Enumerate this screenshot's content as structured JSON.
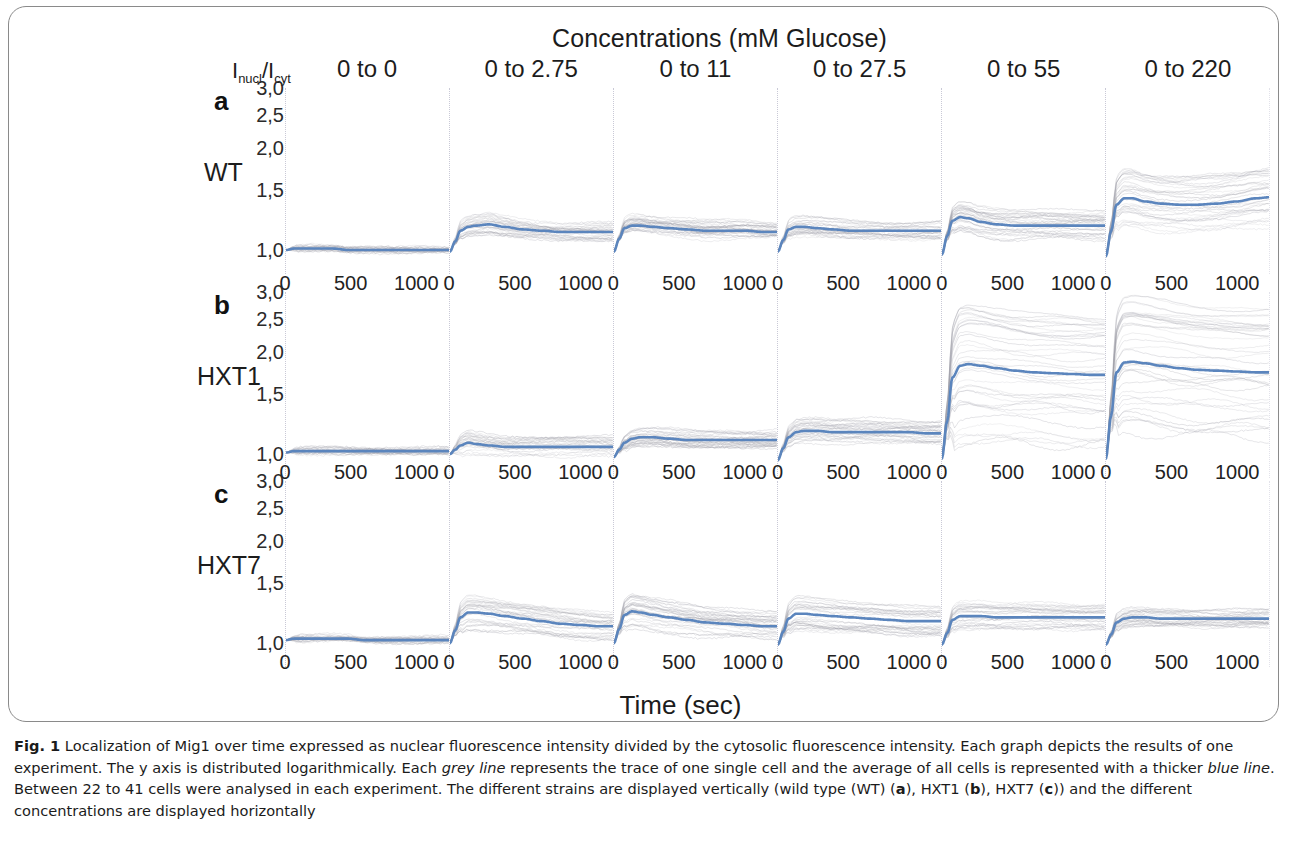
{
  "figure": {
    "title": "Concentrations (mM Glucose)",
    "ratio_axis_label": "Inucl/Icyt",
    "ratio_axis_main": "I",
    "ratio_axis_sub1": "nucl",
    "ratio_axis_slash": "/I",
    "ratio_axis_sub2": "cyt",
    "x_axis_title": "Time (sec)"
  },
  "caption": {
    "figure_number": "Fig. 1",
    "line1": " Localization of Mig1 over time expressed as nuclear fluorescence intensity divided by the cytosolic fluorescence intensity. Each graph depicts the results of one experiment. The y axis is distributed logarithmically. Each ",
    "grey_line": "grey line",
    "line2": " represents the trace of one single cell and the average of all cells is represented with a thicker ",
    "blue_line": "blue line",
    "line3": ". Between 22 to 41 cells were analysed in each experiment. The different strains are displayed vertically (wild type (WT) (",
    "bold_a": "a",
    "line4": "), HXT1 (",
    "bold_b": "b",
    "line5": "), HXT7 (",
    "bold_c": "c",
    "line6": ")) and the different concentrations are displayed horizontally"
  },
  "colors": {
    "average_line": "#5b85bd",
    "cell_trace": "#9a9aa4",
    "grid": "#c9c9d6",
    "text": "#1c1c1c",
    "frame": "#8a8a8a"
  },
  "chart_data": {
    "type": "line",
    "title": "Concentrations (mM Glucose)",
    "xlabel": "Time (sec)",
    "ylabel": "Inucl/Icyt",
    "y_scale": "logarithmic",
    "xlim": [
      0,
      1250
    ],
    "ylim": [
      0.85,
      3.0
    ],
    "xticks": [
      0,
      500,
      1000
    ],
    "xtick_labels": [
      "0",
      "500",
      "1000"
    ],
    "yticks": [
      1.0,
      1.5,
      2.0,
      2.5,
      3.0
    ],
    "ytick_labels": [
      "1,0",
      "1,5",
      "2,0",
      "2,5",
      "3,0"
    ],
    "grid": false,
    "legend": "none",
    "columns": [
      "0 to 0",
      "0 to 2.75",
      "0 to 11",
      "0 to 27.5",
      "0 to 55",
      "0 to 220"
    ],
    "rows": [
      {
        "panel": "a",
        "strain": "WT"
      },
      {
        "panel": "b",
        "strain": "HXT1"
      },
      {
        "panel": "c",
        "strain": "HXT7"
      }
    ],
    "cells_analysed_range": "22 to 41",
    "panels": [
      {
        "row": "a",
        "strain": "WT",
        "column": "0 to 0",
        "average": {
          "x": [
            0,
            60,
            120,
            240,
            360,
            480,
            600,
            720,
            840,
            960,
            1080,
            1200
          ],
          "y": [
            1.0,
            1.01,
            1.01,
            1.01,
            1.01,
            1.0,
            1.0,
            1.0,
            1.0,
            1.0,
            1.0,
            1.0
          ]
        },
        "spread": 0.05,
        "n_traces": 24
      },
      {
        "row": "a",
        "strain": "WT",
        "column": "0 to 2.75",
        "average": {
          "x": [
            0,
            40,
            80,
            140,
            200,
            300,
            420,
            560,
            700,
            850,
            1000,
            1150,
            1250
          ],
          "y": [
            0.99,
            1.06,
            1.14,
            1.17,
            1.18,
            1.19,
            1.17,
            1.15,
            1.14,
            1.13,
            1.13,
            1.13,
            1.13
          ]
        },
        "spread": 0.1,
        "n_traces": 30
      },
      {
        "row": "a",
        "strain": "WT",
        "column": "0 to 11",
        "average": {
          "x": [
            0,
            40,
            80,
            140,
            200,
            300,
            420,
            560,
            700,
            850,
            1000,
            1150,
            1250
          ],
          "y": [
            0.99,
            1.08,
            1.16,
            1.18,
            1.18,
            1.17,
            1.16,
            1.15,
            1.14,
            1.14,
            1.14,
            1.13,
            1.13
          ]
        },
        "spread": 0.11,
        "n_traces": 30
      },
      {
        "row": "a",
        "strain": "WT",
        "column": "0 to 27.5",
        "average": {
          "x": [
            0,
            40,
            80,
            140,
            200,
            300,
            420,
            560,
            700,
            850,
            1000,
            1150,
            1250
          ],
          "y": [
            0.99,
            1.07,
            1.15,
            1.17,
            1.17,
            1.16,
            1.15,
            1.14,
            1.14,
            1.14,
            1.14,
            1.14,
            1.14
          ]
        },
        "spread": 0.1,
        "n_traces": 28
      },
      {
        "row": "a",
        "strain": "WT",
        "column": "0 to 55",
        "average": {
          "x": [
            0,
            40,
            80,
            140,
            200,
            300,
            420,
            560,
            700,
            850,
            1000,
            1150,
            1250
          ],
          "y": [
            0.97,
            1.1,
            1.22,
            1.25,
            1.24,
            1.21,
            1.19,
            1.18,
            1.18,
            1.18,
            1.18,
            1.18,
            1.18
          ]
        },
        "spread": 0.16,
        "n_traces": 32
      },
      {
        "row": "a",
        "strain": "WT",
        "column": "0 to 220",
        "average": {
          "x": [
            0,
            40,
            80,
            140,
            200,
            300,
            420,
            560,
            700,
            850,
            1000,
            1150,
            1250
          ],
          "y": [
            0.96,
            1.14,
            1.36,
            1.42,
            1.42,
            1.39,
            1.37,
            1.36,
            1.36,
            1.37,
            1.39,
            1.42,
            1.43
          ]
        },
        "spread": 0.22,
        "n_traces": 34
      },
      {
        "row": "b",
        "strain": "HXT1",
        "column": "0 to 0",
        "average": {
          "x": [
            0,
            60,
            120,
            240,
            360,
            480,
            600,
            720,
            840,
            960,
            1080,
            1200
          ],
          "y": [
            1.01,
            1.02,
            1.02,
            1.02,
            1.02,
            1.02,
            1.02,
            1.02,
            1.02,
            1.02,
            1.02,
            1.02
          ]
        },
        "spread": 0.05,
        "n_traces": 25
      },
      {
        "row": "b",
        "strain": "HXT1",
        "column": "0 to 2.75",
        "average": {
          "x": [
            0,
            40,
            80,
            140,
            200,
            300,
            420,
            560,
            700,
            850,
            1000,
            1150,
            1250
          ],
          "y": [
            1.0,
            1.03,
            1.06,
            1.08,
            1.07,
            1.06,
            1.05,
            1.05,
            1.05,
            1.05,
            1.05,
            1.05,
            1.05
          ]
        },
        "spread": 0.14,
        "n_traces": 26
      },
      {
        "row": "b",
        "strain": "HXT1",
        "column": "0 to 11",
        "average": {
          "x": [
            0,
            40,
            80,
            140,
            200,
            300,
            420,
            560,
            700,
            850,
            1000,
            1150,
            1250
          ],
          "y": [
            0.98,
            1.03,
            1.08,
            1.11,
            1.12,
            1.12,
            1.11,
            1.1,
            1.1,
            1.1,
            1.1,
            1.1,
            1.1
          ]
        },
        "spread": 0.11,
        "n_traces": 30
      },
      {
        "row": "b",
        "strain": "HXT1",
        "column": "0 to 27.5",
        "average": {
          "x": [
            0,
            40,
            80,
            140,
            200,
            300,
            420,
            560,
            700,
            850,
            1000,
            1150,
            1250
          ],
          "y": [
            0.96,
            1.04,
            1.12,
            1.16,
            1.17,
            1.17,
            1.16,
            1.16,
            1.16,
            1.16,
            1.16,
            1.15,
            1.15
          ]
        },
        "spread": 0.13,
        "n_traces": 30
      },
      {
        "row": "b",
        "strain": "HXT1",
        "column": "0 to 55",
        "average": {
          "x": [
            0,
            40,
            80,
            140,
            200,
            300,
            420,
            560,
            700,
            850,
            1000,
            1150,
            1250
          ],
          "y": [
            0.97,
            1.25,
            1.68,
            1.82,
            1.84,
            1.82,
            1.79,
            1.76,
            1.74,
            1.73,
            1.72,
            1.71,
            1.71
          ]
        },
        "spread": 0.38,
        "n_traces": 36
      },
      {
        "row": "b",
        "strain": "HXT1",
        "column": "0 to 220",
        "average": {
          "x": [
            0,
            40,
            80,
            140,
            200,
            300,
            420,
            560,
            700,
            850,
            1000,
            1150,
            1250
          ],
          "y": [
            0.97,
            1.3,
            1.74,
            1.86,
            1.87,
            1.85,
            1.82,
            1.79,
            1.77,
            1.76,
            1.75,
            1.74,
            1.74
          ]
        },
        "spread": 0.44,
        "n_traces": 38
      },
      {
        "row": "c",
        "strain": "HXT7",
        "column": "0 to 0",
        "average": {
          "x": [
            0,
            60,
            120,
            240,
            360,
            480,
            600,
            720,
            840,
            960,
            1080,
            1200
          ],
          "y": [
            1.02,
            1.03,
            1.03,
            1.03,
            1.03,
            1.03,
            1.02,
            1.02,
            1.02,
            1.02,
            1.02,
            1.02
          ]
        },
        "spread": 0.05,
        "n_traces": 24
      },
      {
        "row": "c",
        "strain": "HXT7",
        "column": "0 to 2.75",
        "average": {
          "x": [
            0,
            40,
            80,
            140,
            200,
            300,
            420,
            560,
            700,
            850,
            1000,
            1150,
            1250
          ],
          "y": [
            1.0,
            1.09,
            1.19,
            1.23,
            1.23,
            1.22,
            1.2,
            1.18,
            1.16,
            1.14,
            1.13,
            1.12,
            1.12
          ]
        },
        "spread": 0.16,
        "n_traces": 30
      },
      {
        "row": "c",
        "strain": "HXT7",
        "column": "0 to 11",
        "average": {
          "x": [
            0,
            40,
            80,
            140,
            200,
            300,
            420,
            560,
            700,
            850,
            1000,
            1150,
            1250
          ],
          "y": [
            1.0,
            1.1,
            1.21,
            1.24,
            1.23,
            1.21,
            1.19,
            1.17,
            1.15,
            1.14,
            1.13,
            1.12,
            1.12
          ]
        },
        "spread": 0.17,
        "n_traces": 30
      },
      {
        "row": "c",
        "strain": "HXT7",
        "column": "0 to 27.5",
        "average": {
          "x": [
            0,
            40,
            80,
            140,
            200,
            300,
            420,
            560,
            700,
            850,
            1000,
            1150,
            1250
          ],
          "y": [
            0.99,
            1.08,
            1.18,
            1.22,
            1.22,
            1.21,
            1.2,
            1.19,
            1.18,
            1.17,
            1.16,
            1.16,
            1.16
          ]
        },
        "spread": 0.16,
        "n_traces": 30
      },
      {
        "row": "c",
        "strain": "HXT7",
        "column": "0 to 55",
        "average": {
          "x": [
            0,
            40,
            80,
            140,
            200,
            300,
            420,
            560,
            700,
            850,
            1000,
            1150,
            1250
          ],
          "y": [
            0.99,
            1.07,
            1.17,
            1.2,
            1.2,
            1.2,
            1.19,
            1.19,
            1.19,
            1.19,
            1.19,
            1.19,
            1.19
          ]
        },
        "spread": 0.13,
        "n_traces": 28
      },
      {
        "row": "c",
        "strain": "HXT7",
        "column": "0 to 220",
        "average": {
          "x": [
            0,
            40,
            80,
            140,
            200,
            300,
            420,
            560,
            700,
            850,
            1000,
            1150,
            1250
          ],
          "y": [
            0.99,
            1.06,
            1.15,
            1.18,
            1.19,
            1.19,
            1.18,
            1.18,
            1.18,
            1.18,
            1.18,
            1.18,
            1.18
          ]
        },
        "spread": 0.14,
        "n_traces": 28
      }
    ]
  }
}
